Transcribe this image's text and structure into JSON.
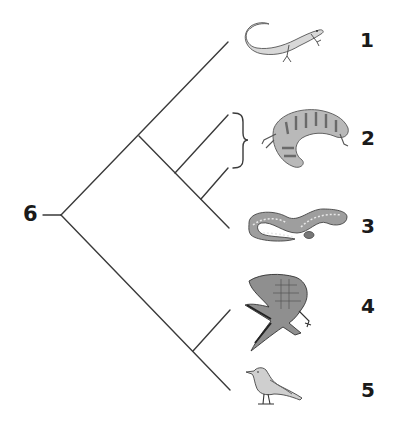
{
  "diagram": {
    "type": "cladogram",
    "root_label": "6",
    "tips": [
      {
        "label": "1",
        "organism": "lizard-icon"
      },
      {
        "label": "2",
        "organism": "gila-monster-icon"
      },
      {
        "label": "3",
        "organism": "snake-icon"
      },
      {
        "label": "4",
        "organism": "crocodile-icon"
      },
      {
        "label": "5",
        "organism": "bird-icon"
      }
    ],
    "bracket": {
      "spans_branches_to": "2",
      "position": "between lines into tip 2"
    },
    "line_color": "#3a3a3a"
  }
}
